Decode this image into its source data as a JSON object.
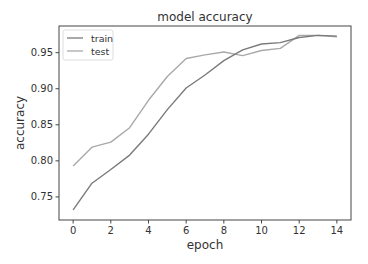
{
  "chart_data": {
    "type": "line",
    "title": "model accuracy",
    "xlabel": "epoch",
    "ylabel": "accuracy",
    "x": [
      0,
      1,
      2,
      3,
      4,
      5,
      6,
      7,
      8,
      9,
      10,
      11,
      12,
      13,
      14
    ],
    "series": [
      {
        "name": "train",
        "color": "#7a7a7a",
        "values": [
          0.732,
          0.769,
          0.788,
          0.808,
          0.837,
          0.871,
          0.901,
          0.919,
          0.939,
          0.954,
          0.962,
          0.964,
          0.971,
          0.974,
          0.973
        ]
      },
      {
        "name": "test",
        "color": "#a9a9a9",
        "values": [
          0.793,
          0.819,
          0.826,
          0.846,
          0.884,
          0.917,
          0.942,
          0.947,
          0.951,
          0.946,
          0.953,
          0.956,
          0.974,
          0.974,
          0.972
        ]
      }
    ],
    "xlim": [
      -0.75,
      14.75
    ],
    "ylim": [
      0.718,
      0.987
    ],
    "xticks": [
      0,
      2,
      4,
      6,
      8,
      10,
      12,
      14
    ],
    "yticks": [
      0.75,
      0.8,
      0.85,
      0.9,
      0.95
    ],
    "ytick_labels": [
      "0.75",
      "0.80",
      "0.85",
      "0.90",
      "0.95"
    ],
    "grid": false,
    "legend": {
      "position": "top-left",
      "entries": [
        "train",
        "test"
      ]
    }
  }
}
